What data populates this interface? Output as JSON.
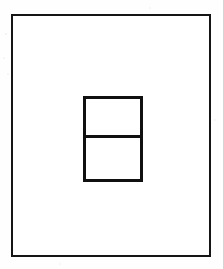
{
  "figure": {
    "description": "A large empty rectangle outline containing a smaller upright rectangle that is split into two stacked cells by a horizontal line.",
    "background_color": "#fefefe",
    "fill_color": "#ffffff",
    "stroke_color": "#151515",
    "canvas": {
      "width": 223,
      "height": 269
    },
    "shapes": {
      "outer_rectangle": {
        "name": "outer rectangle",
        "x": 11,
        "y": 14,
        "width": 200,
        "height": 243,
        "stroke_width": 2,
        "stroke_color": "#151515",
        "fill": "#ffffff"
      },
      "inner_rectangle": {
        "name": "inner divided rectangle",
        "x": 83,
        "y": 96,
        "width": 60,
        "height": 86,
        "stroke_width": 3,
        "stroke_color": "#101010",
        "fill": "#ffffff",
        "divider": {
          "name": "horizontal divider line",
          "orientation": "horizontal",
          "y": 135,
          "stroke_width": 3,
          "stroke_color": "#101010"
        },
        "cells": [
          {
            "name": "upper cell",
            "height": 39,
            "fill": "#ffffff"
          },
          {
            "name": "lower cell",
            "height": 44,
            "fill": "#ffffff"
          }
        ]
      }
    }
  },
  "chart_data": {
    "type": "diagram",
    "xlabel": "",
    "ylabel": "",
    "grid": false,
    "legend": null,
    "elements": [
      {
        "id": "outer-rectangle",
        "shape": "rectangle",
        "x": 11,
        "y": 14,
        "width": 200,
        "height": 243,
        "stroke": "#151515",
        "stroke_width": 2,
        "fill": "none"
      },
      {
        "id": "inner-rectangle",
        "shape": "rectangle",
        "x": 83,
        "y": 96,
        "width": 60,
        "height": 86,
        "stroke": "#101010",
        "stroke_width": 3,
        "fill": "none"
      },
      {
        "id": "inner-divider",
        "shape": "line",
        "x1": 83,
        "y1": 135,
        "x2": 143,
        "y2": 135,
        "stroke": "#101010",
        "stroke_width": 3
      }
    ]
  }
}
